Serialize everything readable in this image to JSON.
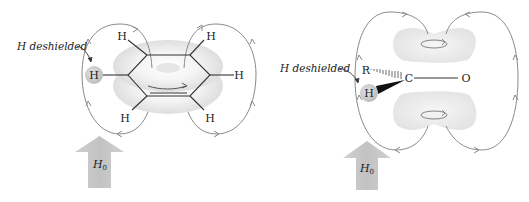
{
  "figure": {
    "left_panel": {
      "title": "Benzene ring current",
      "annotation": "H deshielded",
      "atoms": {
        "h_deshielded": "H",
        "h_top_left": "H",
        "h_top_right": "H",
        "h_right": "H",
        "h_bottom_left": "H",
        "h_bottom_right": "H"
      },
      "field_label": "H",
      "field_subscript": "0"
    },
    "right_panel": {
      "title": "Carbonyl (aldehyde) anisotropy",
      "annotation": "H deshielded",
      "atoms": {
        "r": "R",
        "c": "C",
        "o": "O",
        "h": "H"
      },
      "field_label": "H",
      "field_subscript": "0"
    },
    "colors": {
      "field_lines": "#8a8a8a",
      "electron_cloud": "#e8e8e8",
      "arrow": "#c8c8c8",
      "h_circle": "#cfcfcf"
    }
  }
}
